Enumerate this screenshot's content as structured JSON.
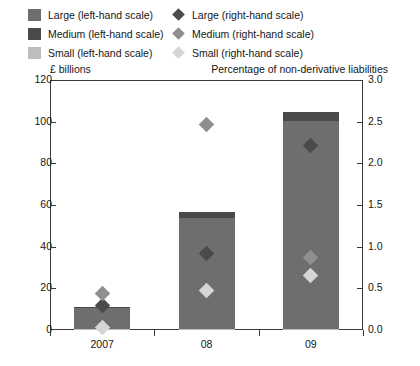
{
  "legend": {
    "left_column": [
      {
        "label": "Large (left-hand scale)",
        "marker": "square-swatch",
        "color": "#6e6e6e"
      },
      {
        "label": "Medium (left-hand scale)",
        "marker": "square-swatch",
        "color": "#4a4a4a"
      },
      {
        "label": "Small (left-hand scale)",
        "marker": "square-swatch",
        "color": "#bdbdbd"
      }
    ],
    "right_column": [
      {
        "label": "Large (right-hand scale)",
        "marker": "diamond-marker",
        "color": "#4a4a4a"
      },
      {
        "label": "Medium (right-hand scale)",
        "marker": "diamond-marker",
        "color": "#8f8f8f"
      },
      {
        "label": "Small (right-hand scale)",
        "marker": "diamond-marker",
        "color": "#d5d5d5"
      }
    ]
  },
  "axes": {
    "left_caption": "£ billions",
    "right_caption": "Percentage of non-derivative liabilities",
    "left_ticks": [
      "120",
      "100",
      "80",
      "60",
      "40",
      "20",
      "0"
    ],
    "right_ticks": [
      "3.0",
      "2.5",
      "2.0",
      "1.5",
      "1.0",
      "0.5",
      "0.0"
    ]
  },
  "chart_data": {
    "type": "bar",
    "title": "",
    "subtitle": "",
    "xlabel": "",
    "ylabel": "£ billions",
    "y2label": "Percentage of non-derivative liabilities",
    "categories": [
      "2007",
      "08",
      "09"
    ],
    "ylim": [
      0,
      120
    ],
    "y2lim": [
      0,
      3.0
    ],
    "grid": false,
    "legend_position": "top",
    "stacked": true,
    "bar_series": [
      {
        "name": "Large (left-hand scale)",
        "axis": "left",
        "color": "#6e6e6e",
        "values": [
          10.0,
          53.0,
          100.0
        ]
      },
      {
        "name": "Medium (left-hand scale)",
        "axis": "left",
        "color": "#4a4a4a",
        "values": [
          0.8,
          3.0,
          4.0
        ]
      },
      {
        "name": "Small (left-hand scale)",
        "axis": "left",
        "color": "#bdbdbd",
        "values": [
          0.4,
          0.5,
          0.5
        ]
      }
    ],
    "bar_totals": [
      11.2,
      56.5,
      104.5
    ],
    "point_series": [
      {
        "name": "Large (right-hand scale)",
        "axis": "right",
        "color": "#4a4a4a",
        "marker": "diamond",
        "values": [
          0.3,
          0.92,
          2.21
        ]
      },
      {
        "name": "Medium (right-hand scale)",
        "axis": "right",
        "color": "#8f8f8f",
        "marker": "diamond",
        "values": [
          0.44,
          2.47,
          0.87
        ]
      },
      {
        "name": "Small (right-hand scale)",
        "axis": "right",
        "color": "#d5d5d5",
        "marker": "diamond",
        "values": [
          0.03,
          0.48,
          0.65
        ]
      }
    ]
  }
}
